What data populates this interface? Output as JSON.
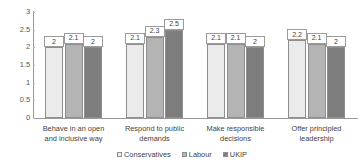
{
  "chart_data": {
    "type": "bar",
    "title": "",
    "subtitle": "",
    "xlabel": "",
    "ylabel": "",
    "ylim": [
      0,
      3
    ],
    "ytick_labels": [
      "3",
      "2.5",
      "2",
      "1.5",
      "1",
      "0.5",
      "0"
    ],
    "ytick_values": [
      3,
      2.5,
      2,
      1.5,
      1,
      0.5,
      0
    ],
    "grid": false,
    "legend_position": "bottom",
    "categories": [
      "Behave in an open and inclusive way",
      "Respond to public demands",
      "Make responsible decisions",
      "Offer principled leadership"
    ],
    "category_lines": [
      [
        "Behave in an open",
        "and inclusive way"
      ],
      [
        "Respond to public",
        "demands"
      ],
      [
        "Make responsible",
        "decisions"
      ],
      [
        "Offer principled",
        "leadership"
      ]
    ],
    "series": [
      {
        "name": "Conservatives",
        "color": "#ebebeb",
        "values": [
          2,
          2.1,
          2.1,
          2.2
        ],
        "labels": [
          "2",
          "2.1",
          "2.1",
          "2.2"
        ]
      },
      {
        "name": "Labour",
        "color": "#b4b4b4",
        "values": [
          2.1,
          2.3,
          2.1,
          2.1
        ],
        "labels": [
          "2.1",
          "2.3",
          "2.1",
          "2.1"
        ]
      },
      {
        "name": "UKIP",
        "color": "#7d7d7d",
        "values": [
          2,
          2.5,
          2,
          2
        ],
        "labels": [
          "2",
          "2.5",
          "2",
          "2"
        ]
      }
    ]
  },
  "axis": {
    "line_color": "#9a9a9a"
  },
  "legend": {
    "items": [
      {
        "label": "Conservatives",
        "color": "#ebebeb"
      },
      {
        "label": "Labour",
        "color": "#b4b4b4"
      },
      {
        "label": "UKIP",
        "color": "#7d7d7d"
      }
    ]
  }
}
